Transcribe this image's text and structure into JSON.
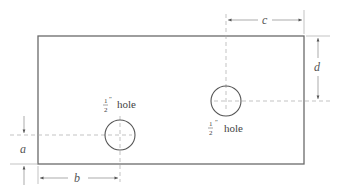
{
  "diagram": {
    "type": "engineering-drawing",
    "plate": {
      "x1": 38,
      "y1": 36,
      "x2": 304,
      "y2": 164
    },
    "holes": [
      {
        "id": "left",
        "cx": 120,
        "cy": 135,
        "r": 15,
        "size_num": "1",
        "size_den": "2",
        "inch_mark": "″",
        "label": "hole",
        "label_position": "above"
      },
      {
        "id": "right",
        "cx": 226,
        "cy": 101,
        "r": 15,
        "size_num": "1",
        "size_den": "2",
        "inch_mark": "″",
        "label": "hole",
        "label_position": "below"
      }
    ],
    "dimensions": {
      "a": {
        "label": "a",
        "description": "vertical distance from bottom edge to left hole center"
      },
      "b": {
        "label": "b",
        "description": "horizontal distance from left edge to left hole center"
      },
      "c": {
        "label": "c",
        "description": "horizontal distance from right hole center to right edge"
      },
      "d": {
        "label": "d",
        "description": "vertical distance from top edge to right hole center"
      }
    }
  }
}
